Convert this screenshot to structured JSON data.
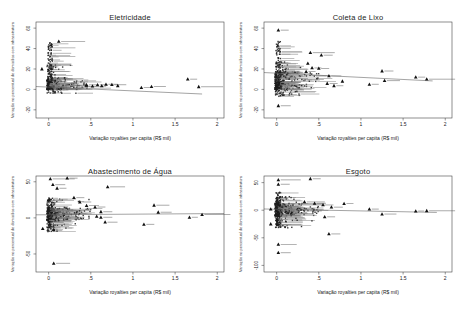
{
  "figure": {
    "background": "#ffffff",
    "n_panels": 4,
    "grid": "2x2"
  },
  "style": {
    "marker_color": "#1c1c1c",
    "outlier_color": "#111111",
    "point_label_color": "#858585",
    "fit_line_color": "#666666",
    "axis_color": "#444444",
    "tick_color": "#333333",
    "text_color": "#222222"
  },
  "chart_data": [
    {
      "type": "scatter",
      "title": "Eletricidade",
      "xlabel": "Variação royalties per capita (R$ mil)",
      "ylabel": "Variação no percentual de domicílios com infraestrutura",
      "legend": "none",
      "grid": "off",
      "xlim": [
        -0.15,
        2.08
      ],
      "ylim": [
        -28,
        66
      ],
      "xticks": [
        0,
        0.5,
        1,
        1.5,
        2
      ],
      "xtick_labels": [
        "0",
        ".5",
        "1",
        "1.5",
        "2"
      ],
      "yticks": [
        -20,
        0,
        20,
        40,
        60
      ],
      "ytick_labels": [
        "-20",
        "0",
        "20",
        "40",
        "60"
      ],
      "trend": {
        "x1": -0.15,
        "y1": 2.8,
        "x2": 1.82,
        "y2": -4.5
      },
      "outliers": [
        [
          -0.08,
          20,
          0
        ],
        [
          0.12,
          47,
          24
        ],
        [
          0.45,
          4.5,
          10
        ],
        [
          0.52,
          3.2,
          0
        ],
        [
          0.58,
          4.5,
          8
        ],
        [
          0.63,
          3.5,
          0
        ],
        [
          0.68,
          5.0,
          9
        ],
        [
          0.75,
          4.6,
          12
        ],
        [
          0.82,
          3.6,
          0
        ],
        [
          1.1,
          1.8,
          6
        ],
        [
          1.22,
          2.8,
          12
        ],
        [
          1.65,
          10.0,
          7
        ],
        [
          1.78,
          2.6,
          22
        ]
      ],
      "cluster": {
        "seed": 11,
        "n": 430,
        "x_exp_mean": 0.085,
        "x_max": 0.5,
        "label_frac": 0.28,
        "bands": [
          {
            "frac": 0.52,
            "y": [
              0,
              12
            ],
            "pow": 2.2
          },
          {
            "frac": 0.26,
            "y": [
              1,
              46
            ],
            "pow": 1.4,
            "col": true
          },
          {
            "frac": 0.1,
            "y": [
              8,
              24
            ],
            "pow": 1.2
          },
          {
            "frac": 0.05,
            "y": [
              -4,
              1
            ],
            "pow": 1.0
          },
          {
            "frac": 0.07,
            "y": [
              0.5,
              8
            ],
            "pow": 1.0,
            "xu": [
              0.1,
              0.47
            ]
          }
        ]
      }
    },
    {
      "type": "scatter",
      "title": "Coleta de Lixo",
      "xlabel": "Variação royalties per capita (R$ mil)",
      "ylabel": "Variação no percentual de domicílios com infraestrutura",
      "legend": "none",
      "grid": "off",
      "xlim": [
        -0.15,
        2.08
      ],
      "ylim": [
        -28,
        66
      ],
      "xticks": [
        0,
        0.5,
        1,
        1.5,
        2
      ],
      "xtick_labels": [
        "0",
        ".5",
        "1",
        "1.5",
        "2"
      ],
      "yticks": [
        -20,
        0,
        20,
        40,
        60
      ],
      "ytick_labels": [
        "-20",
        "0",
        "20",
        "40",
        "60"
      ],
      "trend": {
        "x1": -0.15,
        "y1": 16.5,
        "x2": 1.85,
        "y2": 8.3
      },
      "outliers": [
        [
          0.02,
          58,
          8
        ],
        [
          0.4,
          36,
          22
        ],
        [
          0.53,
          33.5,
          9
        ],
        [
          0.37,
          25.5,
          0
        ],
        [
          0.42,
          21,
          7
        ],
        [
          0.5,
          20.5,
          8
        ],
        [
          0.35,
          17.5,
          7
        ],
        [
          0.62,
          13.2,
          10
        ],
        [
          0.6,
          5.8,
          8
        ],
        [
          0.68,
          3.6,
          7
        ],
        [
          0.78,
          8.0,
          0
        ],
        [
          1.1,
          5.0,
          7
        ],
        [
          1.25,
          18.0,
          9
        ],
        [
          1.28,
          8.6,
          13
        ],
        [
          1.65,
          12.0,
          7
        ],
        [
          1.78,
          10.0,
          26
        ],
        [
          0.02,
          -16,
          10
        ]
      ],
      "cluster": {
        "seed": 22,
        "n": 430,
        "x_exp_mean": 0.085,
        "x_max": 0.5,
        "label_frac": 0.28,
        "bands": [
          {
            "frac": 0.38,
            "y": [
              0,
              18
            ],
            "pow": 1.3
          },
          {
            "frac": 0.28,
            "y": [
              1,
              47
            ],
            "pow": 1.3,
            "col": true
          },
          {
            "frac": 0.15,
            "y": [
              4,
              27
            ],
            "pow": 1.1
          },
          {
            "frac": 0.1,
            "y": [
              -7,
              2
            ],
            "pow": 1.0
          },
          {
            "frac": 0.09,
            "y": [
              1,
              16
            ],
            "pow": 1.0,
            "xu": [
              0.1,
              0.5
            ]
          }
        ]
      }
    },
    {
      "type": "scatter",
      "title": "Abastecimento de Água",
      "xlabel": "Variação royalties per capita (R$ mil)",
      "ylabel": "Variação no percentual de domicílios com infraestrutura",
      "legend": "none",
      "grid": "off",
      "xlim": [
        -0.15,
        2.08
      ],
      "ylim": [
        -75,
        58
      ],
      "xticks": [
        0,
        0.5,
        1,
        1.5,
        2
      ],
      "xtick_labels": [
        "0",
        ".5",
        "1",
        "1.5",
        "2"
      ],
      "yticks": [
        -50,
        0,
        50
      ],
      "ytick_labels": [
        "-50",
        "0",
        "50"
      ],
      "trend": {
        "x1": -0.15,
        "y1": 4.2,
        "x2": 2.08,
        "y2": 6.0
      },
      "outliers": [
        [
          0.02,
          54,
          22
        ],
        [
          0.22,
          55,
          8
        ],
        [
          0.05,
          46,
          10
        ],
        [
          0.1,
          41,
          7
        ],
        [
          0.7,
          43,
          15
        ],
        [
          0.3,
          28,
          8
        ],
        [
          0.37,
          22,
          9
        ],
        [
          0.45,
          17,
          10
        ],
        [
          0.55,
          15,
          8
        ],
        [
          0.62,
          8.5,
          9
        ],
        [
          1.25,
          17.5,
          13
        ],
        [
          1.3,
          7.8,
          11
        ],
        [
          0.57,
          2.0,
          0
        ],
        [
          0.62,
          0.8,
          9
        ],
        [
          0.67,
          -6,
          10
        ],
        [
          1.13,
          -9,
          8
        ],
        [
          1.67,
          0.8,
          6
        ],
        [
          1.82,
          4.6,
          26
        ],
        [
          -0.07,
          -15,
          0
        ],
        [
          0.06,
          -16.5,
          7
        ],
        [
          0.06,
          -63,
          14
        ]
      ],
      "cluster": {
        "seed": 33,
        "n": 430,
        "x_exp_mean": 0.085,
        "x_max": 0.5,
        "label_frac": 0.28,
        "bands": [
          {
            "frac": 0.42,
            "y": [
              -4,
              14
            ],
            "pow": 1.2
          },
          {
            "frac": 0.24,
            "y": [
              -14,
              28
            ],
            "pow": 1.1,
            "col": true
          },
          {
            "frac": 0.14,
            "y": [
              6,
              26
            ],
            "pow": 1.4
          },
          {
            "frac": 0.11,
            "y": [
              -19,
              -1
            ],
            "pow": 1.2
          },
          {
            "frac": 0.09,
            "y": [
              -3,
              13
            ],
            "pow": 1.0,
            "xu": [
              0.1,
              0.5
            ]
          }
        ]
      }
    },
    {
      "type": "scatter",
      "title": "Esgoto",
      "xlabel": "Variação royalties per capita (R$ mil)",
      "ylabel": "Variação no percentual de domicílios com infraestrutura",
      "legend": "none",
      "grid": "off",
      "xlim": [
        -0.15,
        2.08
      ],
      "ylim": [
        -112,
        62
      ],
      "xticks": [
        0,
        0.5,
        1,
        1.5,
        2
      ],
      "xtick_labels": [
        "0",
        ".5",
        "1",
        "1.5",
        "2"
      ],
      "yticks": [
        -100,
        -50,
        0,
        50
      ],
      "ytick_labels": [
        "-100",
        "-50",
        "0",
        "50"
      ],
      "trend": {
        "x1": -0.15,
        "y1": 2.2,
        "x2": 1.9,
        "y2": -4.0
      },
      "outliers": [
        [
          0.02,
          55,
          20
        ],
        [
          0.4,
          57,
          8
        ],
        [
          0.02,
          47,
          9
        ],
        [
          0.33,
          15,
          18
        ],
        [
          0.45,
          12.5,
          9
        ],
        [
          0.55,
          9.5,
          8
        ],
        [
          0.65,
          5.5,
          9
        ],
        [
          0.8,
          12,
          7
        ],
        [
          0.57,
          -12,
          8
        ],
        [
          1.1,
          2.0,
          7
        ],
        [
          1.25,
          -7,
          12
        ],
        [
          1.65,
          -1.5,
          6
        ],
        [
          1.78,
          -1.0,
          26
        ],
        [
          0.62,
          -43,
          9
        ],
        [
          0.02,
          -62,
          16
        ],
        [
          0.02,
          -77,
          10
        ],
        [
          -0.07,
          2,
          0
        ],
        [
          -0.07,
          -25,
          0
        ]
      ],
      "cluster": {
        "seed": 44,
        "n": 430,
        "x_exp_mean": 0.085,
        "x_max": 0.5,
        "label_frac": 0.28,
        "bands": [
          {
            "frac": 0.4,
            "y": [
              -11,
              13
            ],
            "pow": 1.1
          },
          {
            "frac": 0.26,
            "y": [
              -28,
              33
            ],
            "pow": 1.1,
            "col": true
          },
          {
            "frac": 0.13,
            "y": [
              4,
              28
            ],
            "pow": 1.3
          },
          {
            "frac": 0.12,
            "y": [
              -32,
              -6
            ],
            "pow": 1.2
          },
          {
            "frac": 0.09,
            "y": [
              -6,
              12
            ],
            "pow": 1.0,
            "xu": [
              0.1,
              0.5
            ]
          }
        ]
      }
    }
  ]
}
